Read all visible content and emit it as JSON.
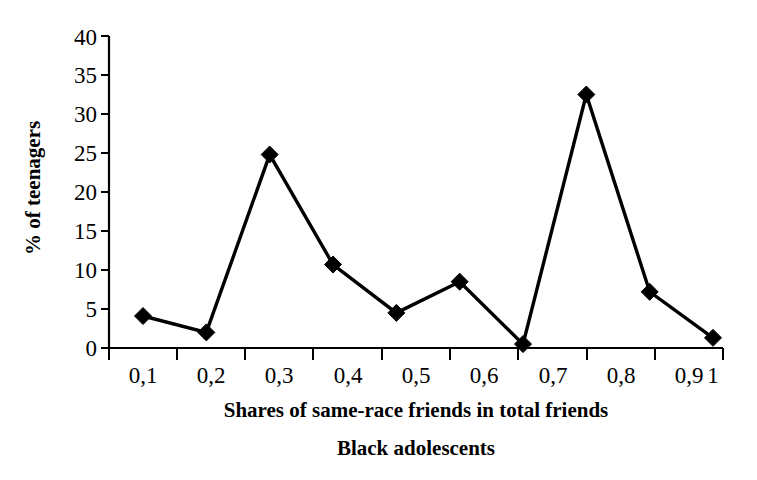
{
  "chart_data": {
    "type": "line",
    "title": "",
    "subtitle": "",
    "caption": "Black adolescents",
    "xlabel": "Shares of same-race friends in total friends",
    "ylabel": "% of teenagers",
    "categories": [
      "0,1",
      "0,2",
      "0,3",
      "0,4",
      "0,5",
      "0,6",
      "0,7",
      "0,8",
      "0,9",
      "1"
    ],
    "x": [
      0.1,
      0.2,
      0.3,
      0.4,
      0.5,
      0.6,
      0.7,
      0.8,
      0.9,
      1.0
    ],
    "values": [
      4.1,
      2.0,
      24.8,
      10.7,
      4.5,
      8.5,
      0.5,
      32.5,
      7.2,
      1.3
    ],
    "series": [
      {
        "name": "% of teenagers",
        "values": [
          4.1,
          2.0,
          24.8,
          10.7,
          4.5,
          8.5,
          0.5,
          32.5,
          7.2,
          1.3
        ]
      }
    ],
    "ylim": [
      0,
      40
    ],
    "yticks": [
      0,
      5,
      10,
      15,
      20,
      25,
      30,
      35,
      40
    ],
    "ytick_labels": [
      "0",
      "5",
      "10",
      "15",
      "20",
      "25",
      "30",
      "35",
      "40"
    ],
    "xtick_labels": [
      "0,1",
      "0,2",
      "0,3",
      "0,4",
      "0,5",
      "0,6",
      "0,7",
      "0,8",
      "0,9",
      "1"
    ],
    "grid": false,
    "legend": false,
    "legend_position": "none",
    "marker": "diamond",
    "line_color": "#000000",
    "marker_color": "#000000",
    "background_color": "#ffffff"
  }
}
